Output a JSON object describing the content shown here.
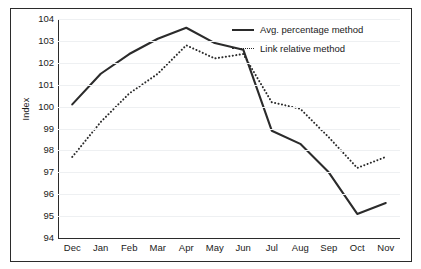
{
  "chart_data": {
    "type": "line",
    "title": "",
    "xlabel": "",
    "ylabel": "Index",
    "categories": [
      "Dec",
      "Jan",
      "Feb",
      "Mar",
      "Apr",
      "May",
      "Jun",
      "Jul",
      "Aug",
      "Sep",
      "Oct",
      "Nov"
    ],
    "ylim": [
      94,
      104
    ],
    "yticks": [
      94,
      95,
      96,
      97,
      98,
      99,
      100,
      101,
      102,
      103,
      104
    ],
    "grid": true,
    "legend_position": "top-right",
    "series": [
      {
        "name": "Avg. percentage method",
        "style": "solid",
        "color": "#2b2b2b",
        "values": [
          100.1,
          101.5,
          102.4,
          103.1,
          103.6,
          102.9,
          102.6,
          98.9,
          98.3,
          97.0,
          95.1,
          95.6
        ]
      },
      {
        "name": "Link relative method",
        "style": "dotted",
        "color": "#2b2b2b",
        "values": [
          97.7,
          99.3,
          100.6,
          101.5,
          102.8,
          102.2,
          102.4,
          100.2,
          99.9,
          98.6,
          97.2,
          97.7
        ]
      }
    ]
  },
  "legend": {
    "items": [
      {
        "label": "Avg. percentage method",
        "style": "solid"
      },
      {
        "label": "Link relative method",
        "style": "dotted"
      }
    ]
  }
}
